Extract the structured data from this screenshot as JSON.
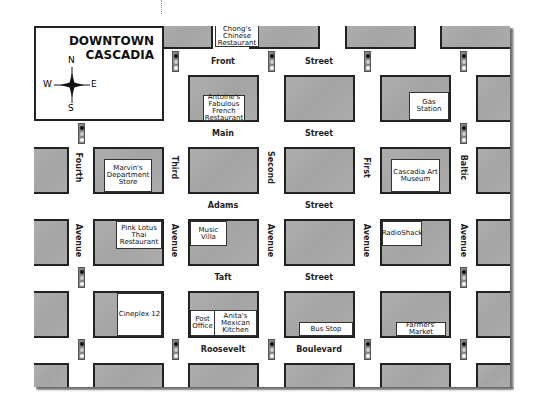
{
  "map": {
    "title_line1": "DOWNTOWN",
    "title_line2": "CASCADIA",
    "compass": {
      "n": "N",
      "s": "S",
      "e": "E",
      "w": "W"
    },
    "streets": [
      {
        "name": "Front",
        "suffix": "Street"
      },
      {
        "name": "Main",
        "suffix": "Street"
      },
      {
        "name": "Adams",
        "suffix": "Street"
      },
      {
        "name": "Taft",
        "suffix": "Street"
      },
      {
        "name": "Roosevelt",
        "suffix": "Boulevard"
      }
    ],
    "avenues": [
      {
        "name": "Fourth",
        "suffix": "Avenue"
      },
      {
        "name": "Third",
        "suffix": "Avenue"
      },
      {
        "name": "Second",
        "suffix": "Avenue"
      },
      {
        "name": "First",
        "suffix": "Avenue"
      },
      {
        "name": "Baltic",
        "suffix": "Avenue"
      }
    ],
    "places": {
      "chongs": "Chong's Chinese Restaurant",
      "antoines": "Antoine's Fabulous French Restaurant",
      "gas": "Gas Station",
      "marvins": "Marvin's Department Store",
      "art": "Cascadia Art Museum",
      "pinklotus": "Pink Lotus Thai Restaurant",
      "music": "Music Villa",
      "radioshack": "RadioShack",
      "cineplex": "Cineplex 12",
      "post": "Post Office",
      "anitas": "Anita's Mexican Kitchen",
      "bus": "Bus Stop",
      "farmers": "Farmers' Market"
    },
    "colors": {
      "block": "#a9a9a9",
      "border": "#222222",
      "road": "#ffffff"
    }
  }
}
